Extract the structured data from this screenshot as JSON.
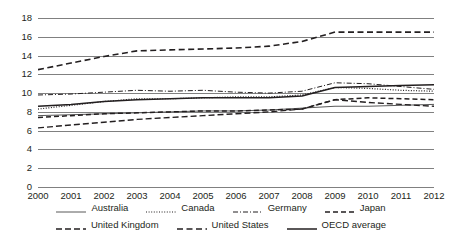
{
  "chart_data": {
    "type": "line",
    "title": "",
    "subtitle": "",
    "xlabel": "",
    "ylabel": "",
    "x": [
      2000,
      2001,
      2002,
      2003,
      2004,
      2005,
      2006,
      2007,
      2008,
      2009,
      2010,
      2011,
      2012
    ],
    "xtick_labels": [
      "2000",
      "2001",
      "2002",
      "2003",
      "2004",
      "2005",
      "2006",
      "2007",
      "2008",
      "2009",
      "2010",
      "2011",
      "2012"
    ],
    "ytick_labels": [
      "0",
      "2",
      "4",
      "6",
      "8",
      "10",
      "12",
      "14",
      "16",
      "18"
    ],
    "yticks": [
      0,
      2,
      4,
      6,
      8,
      10,
      12,
      14,
      16,
      18
    ],
    "ylim": [
      0,
      18
    ],
    "grid": "horizontal",
    "legend_position": "bottom",
    "series": [
      {
        "name": "Australia",
        "style": "solid",
        "color": "#595959",
        "width": 1.0,
        "values": [
          7.6,
          7.7,
          7.8,
          7.9,
          8.0,
          8.1,
          8.1,
          8.2,
          8.4,
          8.6,
          8.6,
          8.7,
          8.8
        ]
      },
      {
        "name": "Canada",
        "style": "dotted",
        "color": "#231f20",
        "width": 1.2,
        "values": [
          8.3,
          8.7,
          9.1,
          9.4,
          9.4,
          9.5,
          9.6,
          9.6,
          9.8,
          10.6,
          10.5,
          10.3,
          10.2
        ]
      },
      {
        "name": "Germany",
        "style": "dashdot",
        "color": "#231f20",
        "width": 1.0,
        "values": [
          9.8,
          9.9,
          10.1,
          10.3,
          10.2,
          10.3,
          10.1,
          10.0,
          10.2,
          11.1,
          11.0,
          10.7,
          10.4
        ]
      },
      {
        "name": "Japan",
        "style": "dashed",
        "color": "#231f20",
        "width": 1.5,
        "values": [
          7.4,
          7.6,
          7.8,
          7.9,
          8.0,
          8.1,
          8.1,
          8.2,
          8.3,
          9.3,
          9.5,
          9.4,
          9.3
        ]
      },
      {
        "name": "United Kingdom",
        "style": "longdash",
        "color": "#231f20",
        "width": 1.4,
        "values": [
          6.3,
          6.6,
          6.9,
          7.2,
          7.4,
          7.6,
          7.8,
          8.0,
          8.3,
          9.3,
          9.0,
          8.8,
          8.6
        ]
      },
      {
        "name": "United States",
        "style": "meddash",
        "color": "#231f20",
        "width": 1.6,
        "values": [
          12.5,
          13.2,
          13.9,
          14.5,
          14.6,
          14.7,
          14.8,
          15.0,
          15.5,
          16.5,
          16.5,
          16.5,
          16.5
        ]
      },
      {
        "name": "OECD average",
        "style": "solid",
        "color": "#231f20",
        "width": 1.5,
        "values": [
          8.6,
          8.8,
          9.1,
          9.3,
          9.4,
          9.5,
          9.5,
          9.5,
          9.7,
          10.6,
          10.7,
          10.8,
          10.9
        ]
      }
    ]
  },
  "legend": {
    "rows": [
      [
        "Australia",
        "Canada",
        "Germany",
        "Japan"
      ],
      [
        "United Kingdom",
        "United States",
        "OECD average"
      ]
    ],
    "items": [
      {
        "label": "Australia"
      },
      {
        "label": "Canada"
      },
      {
        "label": "Germany"
      },
      {
        "label": "Japan"
      },
      {
        "label": "United Kingdom"
      },
      {
        "label": "United States"
      },
      {
        "label": "OECD average"
      }
    ]
  },
  "colors": {
    "gridline": "#808080",
    "text": "#231f20",
    "background": "#ffffff",
    "series_light": "#595959"
  }
}
